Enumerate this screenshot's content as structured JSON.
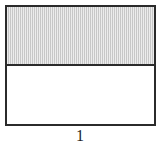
{
  "figure": {
    "label": "1",
    "caption_position": "below",
    "outline_color": "#2b2b2b",
    "outline_width_px": 2,
    "background_color": "#ffffff"
  },
  "shape": {
    "type": "rectangle",
    "total_parts": 2,
    "shaded_parts": 1,
    "fraction_text": "1/2",
    "orientation": "horizontal-split",
    "bands": [
      {
        "index": 1,
        "state": "shaded",
        "fill_color": "#d4d4d4",
        "height_px": 59
      },
      {
        "index": 2,
        "state": "unshaded",
        "fill_color": "#ffffff",
        "height_px": 58
      }
    ]
  },
  "chart_data": {
    "type": "bar",
    "title": "1",
    "xlabel": "",
    "ylabel": "",
    "categories": [
      "shaded",
      "unshaded"
    ],
    "values": [
      1,
      1
    ],
    "grid": false,
    "legend": "none",
    "annotations": [
      "1"
    ]
  }
}
